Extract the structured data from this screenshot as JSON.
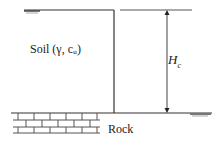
{
  "diagram": {
    "soil_label": "Soil (γ, cᵤ)",
    "height_label_main": "H",
    "height_label_sub": "c",
    "rock_label": "Rock",
    "line_color": "#333333"
  }
}
